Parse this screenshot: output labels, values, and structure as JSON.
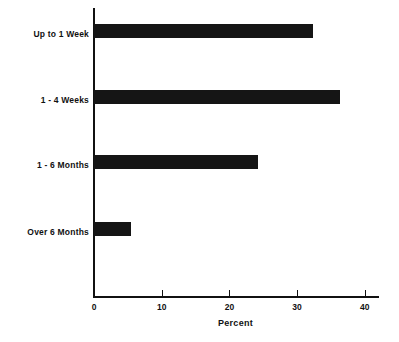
{
  "chart_data": {
    "type": "bar",
    "orientation": "horizontal",
    "title": "",
    "subtitle": "",
    "xlabel": "Percent",
    "ylabel": "",
    "categories": [
      "Up to 1 Week",
      "1 - 4 Weeks",
      "1 - 6 Months",
      "Over 6 Months"
    ],
    "values": [
      32.4,
      36.3,
      24.2,
      5.5
    ],
    "series": [
      {
        "name": "Percent",
        "values": [
          32.4,
          36.3,
          24.2,
          5.5
        ]
      }
    ],
    "xlim": [
      0,
      42
    ],
    "ylim": [
      0,
      4
    ],
    "xticks": [
      0,
      10,
      20,
      30,
      40
    ],
    "xtick_labels": [
      "0",
      "10",
      "20",
      "30",
      "40"
    ],
    "grid": false,
    "legend": false,
    "legend_position": "none",
    "bar_color": "#151515",
    "background_color": "#ffffff",
    "axis_color": "#111111"
  },
  "axes": {
    "x_title": "Percent",
    "ticks": [
      {
        "value": 0,
        "label": "0"
      },
      {
        "value": 10,
        "label": "10"
      },
      {
        "value": 20,
        "label": "20"
      },
      {
        "value": 30,
        "label": "30"
      },
      {
        "value": 40,
        "label": "40"
      }
    ]
  },
  "bars": [
    {
      "label": "Up to 1 Week",
      "value": 32.4
    },
    {
      "label": "1 - 4 Weeks",
      "value": 36.3
    },
    {
      "label": "1 - 6 Months",
      "value": 24.2
    },
    {
      "label": "Over 6 Months",
      "value": 5.5
    }
  ]
}
